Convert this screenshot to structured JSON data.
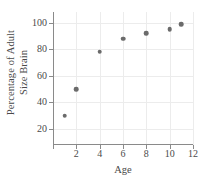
{
  "chart_data": {
    "type": "scatter",
    "title": "",
    "xlabel": "Age",
    "ylabel_lines": [
      "Percentage of Adult",
      "Size Brain"
    ],
    "ylabel": "Percentage of Adult Size Brain",
    "x": [
      1,
      2,
      4,
      6,
      8,
      10,
      11
    ],
    "values": [
      30,
      50,
      78,
      88,
      92,
      95,
      99
    ],
    "points": [
      {
        "x": 1,
        "y": 30
      },
      {
        "x": 2,
        "y": 50
      },
      {
        "x": 4,
        "y": 78
      },
      {
        "x": 6,
        "y": 88
      },
      {
        "x": 8,
        "y": 92
      },
      {
        "x": 10,
        "y": 95
      },
      {
        "x": 11,
        "y": 99
      }
    ],
    "xlim": [
      0,
      12
    ],
    "ylim": [
      8,
      108
    ],
    "xticks": [
      0,
      2,
      4,
      6,
      8,
      10,
      12
    ],
    "xticklabels": [
      "",
      "2",
      "4",
      "6",
      "8",
      "10",
      "12"
    ],
    "yticks": [
      20,
      40,
      60,
      80,
      100
    ],
    "yticklabels": [
      "20",
      "40",
      "60",
      "80",
      "100"
    ],
    "grid": true,
    "legend": null,
    "marker_color": "#6b6b6b",
    "grid_color": "#ececec",
    "axis_color": "#8a8a8a",
    "background": "#ffffff"
  }
}
